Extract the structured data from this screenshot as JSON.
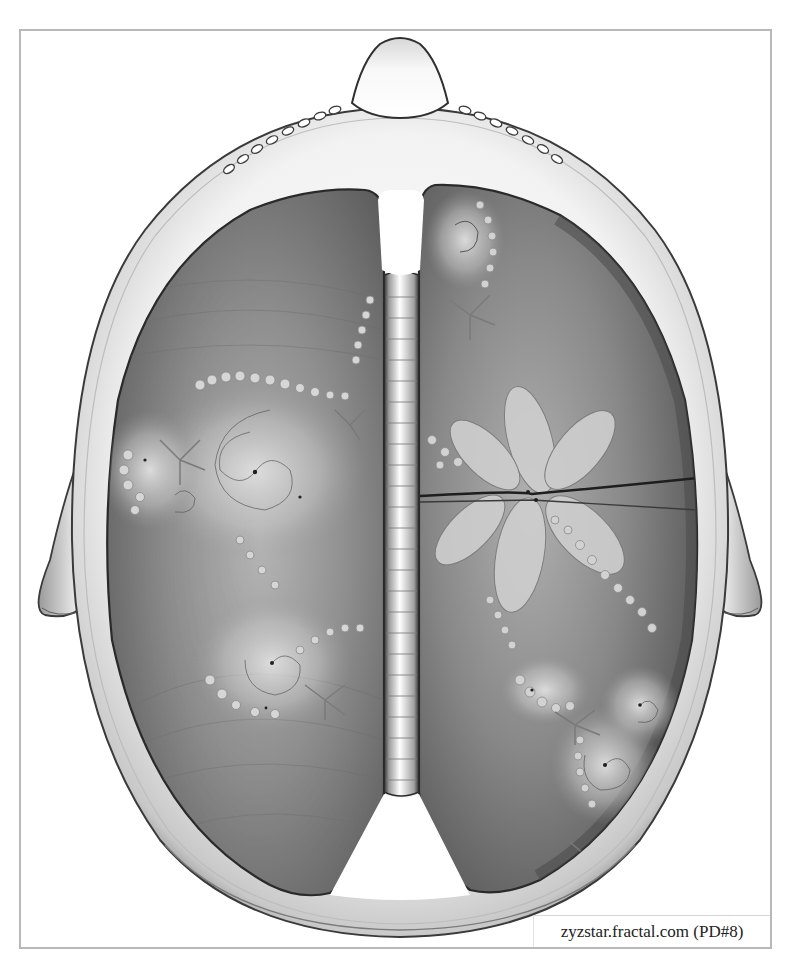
{
  "image": {
    "subject": "Top-down illustration of a head with brain hemispheres rendered as grayscale fractals",
    "colors": {
      "background": "#ffffff",
      "frame_border": "#b8b8b8",
      "skull_light": "#f4f4f4",
      "skull_shadow": "#8a8a8a",
      "skull_outline": "#3a3a3a",
      "lobe_dark": "#555555",
      "lobe_mid": "#8c8c8c",
      "lobe_light": "#c9c9c9",
      "spine_light": "#f2f2f2",
      "spine_edge": "#2e2e2e"
    },
    "regions": {
      "frame": {
        "x": 19,
        "y": 29,
        "w": 753,
        "h": 920
      },
      "nose_tip": {
        "x": 400,
        "y": 38
      },
      "left_ear": {
        "x": 27,
        "y": 600
      },
      "right_ear": {
        "x": 768,
        "y": 600
      },
      "left_hemisphere": {
        "x": 108,
        "y": 187,
        "w": 277,
        "h": 710
      },
      "right_hemisphere": {
        "x": 420,
        "y": 183,
        "w": 278,
        "h": 710
      },
      "spine": {
        "x": 384,
        "y": 275,
        "w": 35,
        "h": 517,
        "segments": 24
      }
    },
    "fractal_centers": {
      "left_main_swirl": {
        "x": 255,
        "y": 472
      },
      "left_lower_swirl": {
        "x": 272,
        "y": 663
      },
      "right_flower": {
        "x": 530,
        "y": 495
      },
      "right_lower_swirl": {
        "x": 605,
        "y": 765
      }
    }
  },
  "caption": {
    "text": "zyzstar.fractal.com (PD#8)"
  }
}
